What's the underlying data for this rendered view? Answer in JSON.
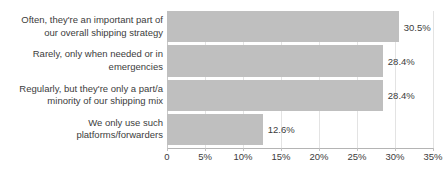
{
  "chart_data": {
    "type": "bar",
    "orientation": "horizontal",
    "title": "",
    "xlabel": "",
    "ylabel": "",
    "categories": [
      "Often, they're an important part of\nour overall shipping strategy",
      "Rarely, only when needed or in\nemergencies",
      "Regularly, but they're only a part/a\nminority of our shipping mix",
      "We only use such\nplatforms/forwarders"
    ],
    "values": [
      30.5,
      28.4,
      28.4,
      12.6
    ],
    "value_labels": [
      "30.5%",
      "28.4%",
      "28.4%",
      "12.6%"
    ],
    "xlim": [
      0,
      35
    ],
    "xticks": [
      0,
      5,
      10,
      15,
      20,
      25,
      30,
      35
    ],
    "xtick_labels": [
      "0",
      "5%",
      "10%",
      "15%",
      "20%",
      "25%",
      "30%",
      "35%"
    ],
    "grid": true,
    "legend": false,
    "bar_color": "#bfbfbf",
    "text_color": "#3c3c3c",
    "grid_color": "#e3e3e3",
    "axis_color": "#b4b4b4"
  }
}
